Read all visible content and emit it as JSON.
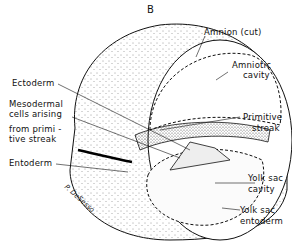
{
  "figure": {
    "panel_label": "B",
    "signature": "P. DeSesso"
  },
  "labels": {
    "amnion": "Amnion (cut)",
    "amniotic_cavity_1": "Amniotic",
    "amniotic_cavity_2": "cavity",
    "ectoderm": "Ectoderm",
    "mesodermal_1": "Mesodermal",
    "mesodermal_2": "cells arising",
    "mesodermal_3": "from primi -",
    "mesodermal_4": "tive streak",
    "primitive_streak_1": "Primitive",
    "primitive_streak_2": "streak",
    "entoderm": "Entoderm",
    "yolk_sac_cavity_1": "Yolk sac",
    "yolk_sac_cavity_2": "cavity",
    "yolk_sac_entoderm_1": "Yolk sac",
    "yolk_sac_entoderm_2": "entoderm"
  }
}
